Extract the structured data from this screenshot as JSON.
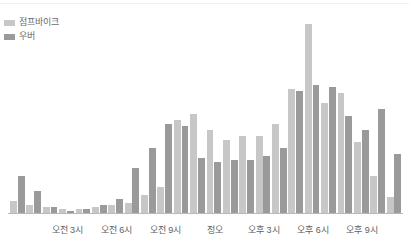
{
  "legend": {
    "position": "top-left",
    "entries": [
      {
        "label": "점프바이크",
        "color": "#c7c7c7",
        "swatch_name": "legend-swatch-jumpbike"
      },
      {
        "label": "우버",
        "color": "#9a9a9a",
        "swatch_name": "legend-swatch-uber"
      }
    ]
  },
  "axis": {
    "tick_labels": [
      "오전 3시",
      "오전 6시",
      "오전 9시",
      "정오",
      "오후 3시",
      "오후 6시",
      "오후 9시"
    ],
    "tick_hours": [
      3,
      6,
      9,
      12,
      15,
      18,
      21
    ],
    "line_color": "#b9b9b9"
  },
  "chart_data": {
    "type": "bar",
    "title": "",
    "subtitle": "",
    "xlabel": "",
    "ylabel": "",
    "grid": false,
    "legend_position": "top-left",
    "ylim": [
      0,
      100
    ],
    "categories": [
      "오전 12시",
      "오전 1시",
      "오전 2시",
      "오전 3시",
      "오전 4시",
      "오전 5시",
      "오전 6시",
      "오전 7시",
      "오전 8시",
      "오전 9시",
      "오전 10시",
      "오전 11시",
      "정오",
      "오후 1시",
      "오후 2시",
      "오후 3시",
      "오후 4시",
      "오후 5시",
      "오후 6시",
      "오후 7시",
      "오후 8시",
      "오후 9시",
      "오후 10시",
      "오후 11시"
    ],
    "series": [
      {
        "name": "점프바이크",
        "color": "#c7c7c7",
        "values": [
          6,
          4,
          3,
          2,
          2,
          3,
          4,
          5,
          9,
          13,
          46,
          49,
          41,
          36,
          38,
          38,
          44,
          61,
          93,
          54,
          59,
          35,
          18,
          8
        ]
      },
      {
        "name": "우버",
        "color": "#9a9a9a",
        "values": [
          18,
          11,
          3,
          1,
          2,
          4,
          7,
          22,
          32,
          44,
          43,
          27,
          25,
          26,
          26,
          28,
          32,
          60,
          63,
          62,
          48,
          41,
          51,
          29
        ]
      }
    ]
  }
}
